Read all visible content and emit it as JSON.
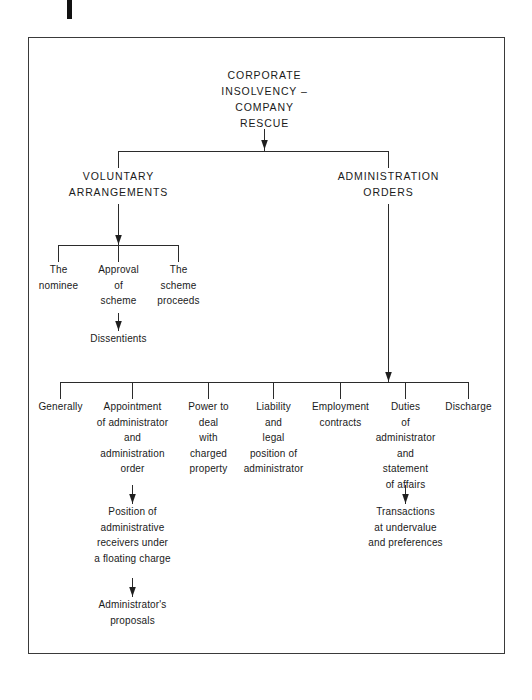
{
  "page": {
    "mark_label": "page-edge-mark",
    "frame_label": "diagram-frame"
  },
  "diagram": {
    "type": "tree",
    "root": "CORPORATE\nINSOLVENCY –\nCOMPANY\nRESCUE",
    "branches": {
      "voluntary": "VOLUNTARY\nARRANGEMENTS",
      "administration": "ADMINISTRATION\nORDERS"
    },
    "voluntary_children": [
      "The\nnominee",
      "Approval\nof\nscheme",
      "The\nscheme\nproceeds"
    ],
    "voluntary_grandchild": "Dissentients",
    "administration_children": [
      "Generally",
      "Appointment\nof administrator\nand\nadministration\norder",
      "Power to\ndeal\nwith\ncharged\nproperty",
      "Liability\nand\nlegal\nposition of\nadministrator",
      "Employment\ncontracts",
      "Duties\nof\nadministrator\nand\nstatement\nof affairs",
      "Discharge"
    ],
    "appointment_child": "Position of\nadministrative\nreceivers under\na floating charge",
    "appointment_grandchild": "Administrator's\nproposals",
    "duties_child": "Transactions\nat undervalue\nand preferences"
  },
  "colors": {
    "ink": "#1a1a1a",
    "line": "#2b2b2b",
    "frame": "#3a3a3a",
    "background": "#ffffff"
  }
}
